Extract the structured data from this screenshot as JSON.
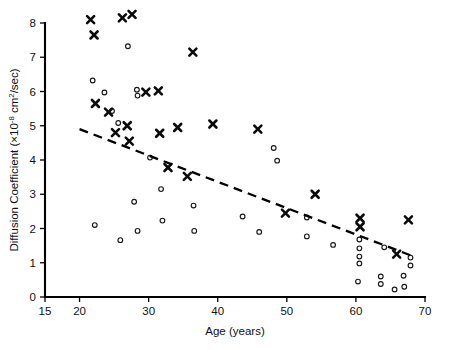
{
  "chart_data": {
    "type": "scatter",
    "title": "",
    "xlabel": "Age (years)",
    "ylabel": "Diffusion Coefficient (×10⁻⁸ cm²/sec)",
    "ylabel_parts": {
      "main": "Diffusion Coefficient (×10",
      "exponent": "-8",
      "tail": " cm",
      "superscript2": "2",
      "end": "/sec)"
    },
    "xlim": [
      15,
      70
    ],
    "ylim": [
      0,
      8
    ],
    "xticks": [
      15,
      20,
      30,
      40,
      50,
      60,
      70
    ],
    "yticks": [
      0,
      1,
      2,
      3,
      4,
      5,
      6,
      7,
      8
    ],
    "grid": false,
    "legend": "none",
    "series": [
      {
        "name": "cross-marker-series",
        "marker": "x",
        "color": "#0b0b0b",
        "points": [
          [
            21.6,
            8.1
          ],
          [
            22.1,
            7.65
          ],
          [
            26.2,
            8.15
          ],
          [
            27.6,
            8.25
          ],
          [
            36.4,
            7.15
          ],
          [
            22.3,
            5.65
          ],
          [
            24.2,
            5.4
          ],
          [
            29.6,
            5.98
          ],
          [
            31.4,
            6.02
          ],
          [
            26.9,
            5.0
          ],
          [
            25.2,
            4.8
          ],
          [
            27.2,
            4.55
          ],
          [
            31.6,
            4.78
          ],
          [
            34.2,
            4.95
          ],
          [
            39.3,
            5.05
          ],
          [
            45.8,
            4.9
          ],
          [
            32.8,
            3.78
          ],
          [
            35.6,
            3.52
          ],
          [
            49.8,
            2.45
          ],
          [
            54.1,
            3.0
          ],
          [
            60.6,
            2.3
          ],
          [
            60.6,
            2.05
          ],
          [
            67.6,
            2.25
          ],
          [
            65.9,
            1.25
          ]
        ]
      },
      {
        "name": "circle-marker-series",
        "marker": "o",
        "color": "#1a1a1a",
        "points": [
          [
            21.9,
            6.32
          ],
          [
            27.0,
            7.32
          ],
          [
            23.6,
            5.97
          ],
          [
            28.3,
            6.05
          ],
          [
            28.4,
            5.88
          ],
          [
            24.7,
            5.43
          ],
          [
            25.6,
            5.08
          ],
          [
            30.2,
            4.07
          ],
          [
            48.1,
            4.35
          ],
          [
            48.6,
            3.98
          ],
          [
            22.2,
            2.1
          ],
          [
            25.9,
            1.66
          ],
          [
            27.9,
            2.78
          ],
          [
            28.4,
            1.93
          ],
          [
            31.8,
            3.15
          ],
          [
            32.0,
            2.23
          ],
          [
            36.5,
            2.67
          ],
          [
            36.6,
            1.93
          ],
          [
            43.6,
            2.35
          ],
          [
            46.0,
            1.9
          ],
          [
            52.9,
            2.32
          ],
          [
            52.9,
            1.77
          ],
          [
            56.7,
            1.52
          ],
          [
            60.5,
            1.68
          ],
          [
            60.5,
            1.42
          ],
          [
            60.5,
            1.18
          ],
          [
            60.5,
            0.98
          ],
          [
            60.3,
            0.45
          ],
          [
            63.6,
            0.6
          ],
          [
            63.6,
            0.38
          ],
          [
            64.1,
            1.45
          ],
          [
            65.6,
            0.22
          ],
          [
            66.9,
            0.62
          ],
          [
            67.0,
            0.3
          ],
          [
            67.9,
            1.15
          ],
          [
            67.9,
            0.92
          ]
        ]
      }
    ],
    "trendline": {
      "name": "dashed-regression-line",
      "style": "dashed",
      "x_start": 20.0,
      "y_start": 4.9,
      "x_end": 68.4,
      "y_end": 1.18
    }
  }
}
